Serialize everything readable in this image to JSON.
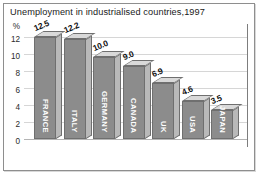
{
  "chart_data": {
    "type": "bar",
    "title": "Unemployment in industrialised countries,1997",
    "xlabel": "",
    "ylabel": "%",
    "ylim": [
      0,
      13
    ],
    "grid": true,
    "legend": "none",
    "yticks": [
      "12",
      "10",
      "8",
      "6",
      "4",
      "2",
      "0"
    ],
    "categories": [
      "FRANCE",
      "ITALY",
      "GERMANY",
      "CANADA",
      "UK",
      "USA",
      "JAPAN"
    ],
    "values": [
      12.5,
      12.2,
      10.0,
      9.0,
      6.9,
      4.6,
      3.5
    ],
    "value_labels": [
      "12.5",
      "12.2",
      "10.0",
      "9.0",
      "6.9",
      "4.6",
      "3.5"
    ]
  },
  "colors": {
    "bar_front": "#8c8c8c",
    "bar_side": "#b9b9b9",
    "bar_top": "#d9d9d9",
    "bar_outline": "#6f6f6f",
    "gridline": "#d6d6d6",
    "frame": "#8e8e8e",
    "title_text": "#1a1a1a",
    "axis_text": "#2b2b2b",
    "bar_label_text": "#ffffff"
  }
}
